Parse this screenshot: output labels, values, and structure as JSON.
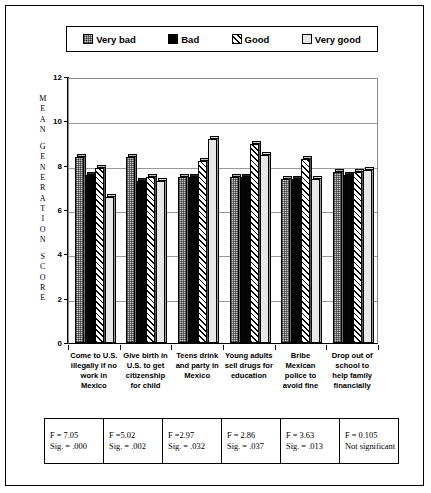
{
  "chart_data": {
    "type": "bar",
    "title": "",
    "xlabel": "",
    "ylabel": "MEAN GENERATION SCORE",
    "ylim": [
      0,
      12
    ],
    "yticks": [
      0,
      2,
      4,
      6,
      8,
      10,
      12
    ],
    "grid": true,
    "legend_position": "top",
    "categories": [
      "Come to U.S. illegally if no work in Mexico",
      "Give birth in U.S. to get citizenship for child",
      "Teens drink and party in Mexico",
      "Young adults sell drugs for education",
      "Bribe Mexican police to avoid fine",
      "Drop out of school to help family financially"
    ],
    "series": [
      {
        "name": "Very bad",
        "values": [
          8.4,
          8.4,
          7.5,
          7.5,
          7.4,
          7.7
        ]
      },
      {
        "name": "Bad",
        "values": [
          7.6,
          7.3,
          7.5,
          7.5,
          7.4,
          7.6
        ]
      },
      {
        "name": "Good",
        "values": [
          7.9,
          7.5,
          8.2,
          9.0,
          8.3,
          7.7
        ]
      },
      {
        "name": "Very good",
        "values": [
          6.6,
          7.3,
          9.2,
          8.5,
          7.4,
          7.8
        ]
      }
    ]
  },
  "legend": {
    "items": [
      {
        "label": "Very bad",
        "pattern": "dotted-grey"
      },
      {
        "label": "Bad",
        "pattern": "solid-black"
      },
      {
        "label": "Good",
        "pattern": "diagonal-hatch"
      },
      {
        "label": "Very good",
        "pattern": "plain-white"
      }
    ]
  },
  "y_axis": {
    "title_letters": [
      "M",
      "E",
      "A",
      "N",
      "",
      "G",
      "E",
      "N",
      "E",
      "R",
      "A",
      "T",
      "I",
      "O",
      "N",
      "",
      "S",
      "C",
      "O",
      "R",
      "E"
    ],
    "tick_labels": [
      "12",
      "10",
      "8",
      "6",
      "4",
      "2",
      "0"
    ]
  },
  "x_axis": {
    "labels": [
      [
        "Come to U.S.",
        "illegally if no",
        "work in",
        "Mexico"
      ],
      [
        "Give birth in",
        "U.S. to get",
        "citizenship",
        "for child"
      ],
      [
        "Teens drink",
        "and party in",
        "Mexico"
      ],
      [
        "Young adults",
        "sell drugs for",
        "education"
      ],
      [
        "Bribe",
        "Mexican",
        "police to",
        "avoid fine"
      ],
      [
        "Drop out of",
        "school to",
        "help family",
        "financially"
      ]
    ]
  },
  "stats_table": {
    "cells": [
      {
        "f": "F = 7.05",
        "sig": "Sig. = .000"
      },
      {
        "f": "F =5.02",
        "sig": "Sig. = .002"
      },
      {
        "f": "F =2.97",
        "sig": "Sig. = .032"
      },
      {
        "f": "F = 2.86",
        "sig": "Sig. = .037"
      },
      {
        "f": "F = 3.63",
        "sig": "Sig. = .013"
      },
      {
        "f": "F = 0.105",
        "sig": "Not significant"
      }
    ]
  }
}
